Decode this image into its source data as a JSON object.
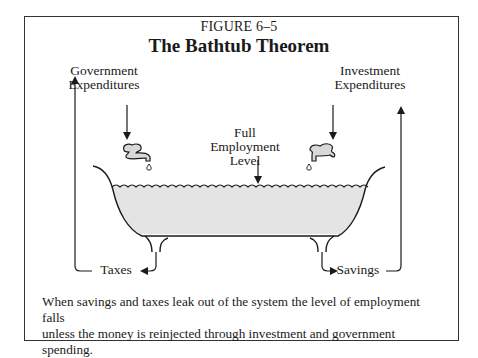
{
  "figure": {
    "number": "FIGURE 6–5",
    "title": "The Bathtub Theorem"
  },
  "labels": {
    "government_expenditures_line1": "Government",
    "government_expenditures_line2": "Expenditures",
    "investment_expenditures_line1": "Investment",
    "investment_expenditures_line2": "Expenditures",
    "full_employment_line1": "Full",
    "full_employment_line2": "Employment",
    "full_employment_line3": "Level",
    "tub_content": "120 Million Jobs",
    "left_leak": "Taxes",
    "right_leak": "Savings"
  },
  "caption": {
    "line1": "When savings and taxes leak out of the system the level of employment falls",
    "line2": "unless the money is reinjected through investment and government spending."
  },
  "colors": {
    "water": "#e4e4e4",
    "stroke": "#1a1a1a",
    "faucet_fill": "#d9d9d9"
  }
}
